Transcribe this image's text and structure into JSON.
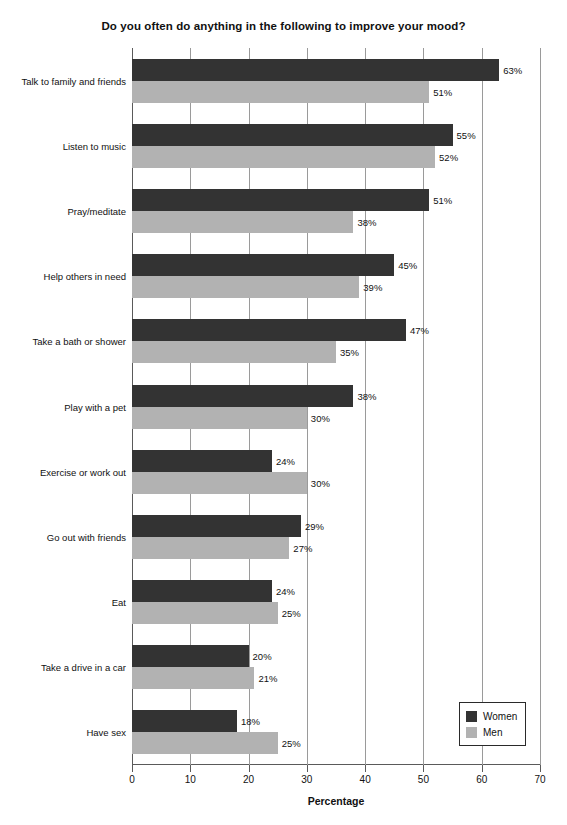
{
  "chart_data": {
    "type": "bar",
    "orientation": "horizontal",
    "title": "Do you often do anything in the following to improve your mood?",
    "xlabel": "Percentage",
    "ylabel": "",
    "xlim": [
      0,
      70
    ],
    "xticks": [
      0,
      10,
      20,
      30,
      40,
      50,
      60,
      70
    ],
    "xtick_labels": [
      "0",
      "10",
      "20",
      "30",
      "40",
      "50",
      "60",
      "70"
    ],
    "grid": true,
    "grid_axis": "x",
    "legend_position": "bottom-right",
    "value_suffix": "%",
    "categories": [
      "Talk to family and friends",
      "Listen to music",
      "Pray/meditate",
      "Help others in need",
      "Take a bath or shower",
      "Play with a pet",
      "Exercise or work out",
      "Go out with friends",
      "Eat",
      "Take a drive in a car",
      "Have sex"
    ],
    "series": [
      {
        "name": "Women",
        "color": "#333333",
        "values": [
          63,
          55,
          51,
          45,
          47,
          38,
          24,
          29,
          24,
          20,
          18
        ],
        "labels": [
          "63%",
          "55%",
          "51%",
          "45%",
          "47%",
          "38%",
          "24%",
          "29%",
          "24%",
          "20%",
          "18%"
        ]
      },
      {
        "name": "Men",
        "color": "#b2b2b2",
        "values": [
          51,
          52,
          38,
          39,
          35,
          30,
          30,
          27,
          25,
          21,
          25
        ],
        "labels": [
          "51%",
          "52%",
          "38%",
          "39%",
          "35%",
          "30%",
          "30%",
          "27%",
          "25%",
          "21%",
          "25%"
        ]
      }
    ]
  }
}
